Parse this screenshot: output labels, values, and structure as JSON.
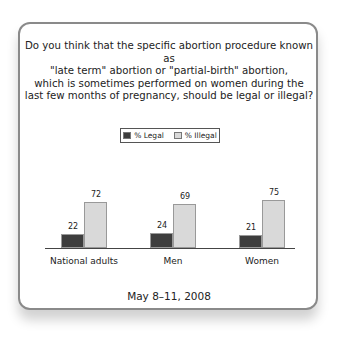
{
  "question": "Do you think that the specific abortion procedure known as \"late term\" abortion or \"partial-birth\" abortion, which is sometimes performed on women during the last few months of pregnancy, should be legal or illegal?",
  "question_lines": [
    "Do you think that the specific abortion procedure known as",
    "\"late term\" abortion or \"partial-birth\" abortion,",
    "which is sometimes performed on women during the",
    "last few months of pregnancy, should be legal or illegal?"
  ],
  "legend": [
    {
      "label": "% Legal",
      "color": "#3d3d3d"
    },
    {
      "label": "% Illegal",
      "color": "#d9d9d9"
    }
  ],
  "date": "May 8–11, 2008",
  "chart_data": {
    "type": "bar",
    "categories": [
      "National adults",
      "Men",
      "Women"
    ],
    "series": [
      {
        "name": "% Legal",
        "values": [
          22,
          24,
          21
        ],
        "color": "#3d3d3d"
      },
      {
        "name": "% Illegal",
        "values": [
          72,
          69,
          75
        ],
        "color": "#d9d9d9"
      }
    ],
    "xlabel": "",
    "ylabel": "",
    "ylim": [
      0,
      100
    ],
    "grid": false,
    "legend_position": "top",
    "footnote": "May 8–11, 2008"
  }
}
